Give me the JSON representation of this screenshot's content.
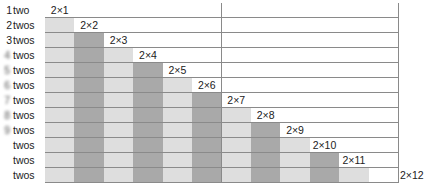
{
  "diagram": {
    "title": "",
    "columns": 24,
    "rows": 12,
    "colors": {
      "light": "#dedede",
      "dark": "#a9a9a9",
      "empty": "#ffffff",
      "grid_line": "#8a8a8a"
    },
    "row_labels": [
      {
        "num": "1",
        "word": "two",
        "num_style": "clear"
      },
      {
        "num": "2",
        "word": "twos",
        "num_style": "clear"
      },
      {
        "num": "3",
        "word": "twos",
        "num_style": "clear"
      },
      {
        "num": "4",
        "word": "twos",
        "num_style": "blur"
      },
      {
        "num": "5",
        "word": "twos",
        "num_style": "blur"
      },
      {
        "num": "6",
        "word": "twos",
        "num_style": "blur"
      },
      {
        "num": "7",
        "word": "twos",
        "num_style": "blur"
      },
      {
        "num": "8",
        "word": "twos",
        "num_style": "blur"
      },
      {
        "num": "9",
        "word": "twos",
        "num_style": "blur"
      },
      {
        "num": "10",
        "word": "twos",
        "num_style": "gone"
      },
      {
        "num": "11",
        "word": "twos",
        "num_style": "gone"
      },
      {
        "num": "12",
        "word": "twos",
        "num_style": "gone"
      }
    ],
    "products": [
      "2×1",
      "2×2",
      "2×3",
      "2×4",
      "2×5",
      "2×6",
      "2×7",
      "2×8",
      "2×9",
      "2×10",
      "2×11",
      "2×12"
    ]
  }
}
